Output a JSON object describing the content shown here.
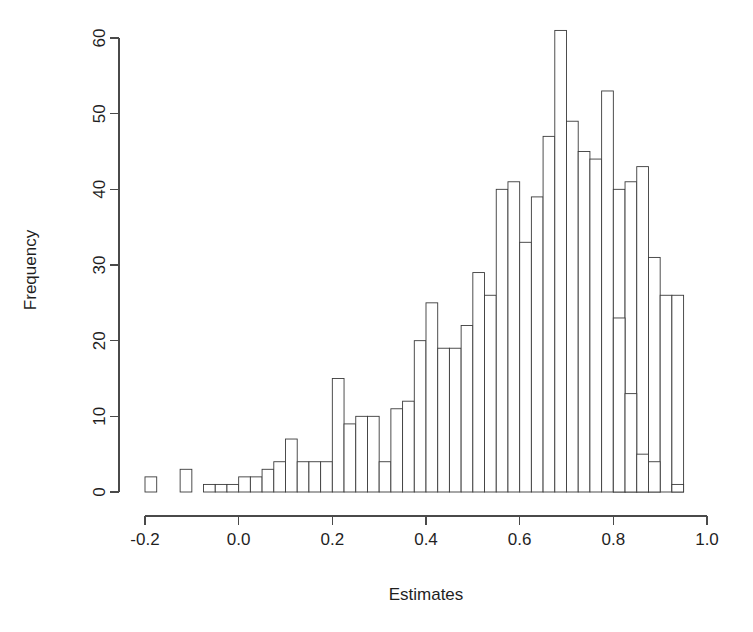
{
  "chart_data": {
    "type": "bar",
    "title": "",
    "subtitle": "",
    "xlabel": "Estimates",
    "ylabel": "Frequency",
    "grid": false,
    "legend": null,
    "xlim": [
      -0.2,
      1.0
    ],
    "ylim": [
      0,
      61
    ],
    "xticks": [
      -0.2,
      0.0,
      0.2,
      0.4,
      0.6,
      0.8,
      1.0
    ],
    "xtick_labels": [
      "-0.2",
      "0.0",
      "0.2",
      "0.4",
      "0.6",
      "0.8",
      "1.0"
    ],
    "yticks": [
      0,
      10,
      20,
      30,
      40,
      50,
      60
    ],
    "ytick_labels": [
      "0",
      "10",
      "20",
      "30",
      "40",
      "50",
      "60"
    ],
    "bin_width": 0.025,
    "bin_starts": [
      -0.2,
      -0.175,
      -0.15,
      -0.125,
      -0.1,
      -0.075,
      -0.05,
      -0.025,
      0.0,
      0.025,
      0.05,
      0.075,
      0.1,
      0.125,
      0.15,
      0.175,
      0.2,
      0.225,
      0.25,
      0.275,
      0.3,
      0.325,
      0.35,
      0.375,
      0.4,
      0.425,
      0.45,
      0.475,
      0.5,
      0.525,
      0.55,
      0.575,
      0.6,
      0.625,
      0.65,
      0.675,
      0.7,
      0.725,
      0.75,
      0.775,
      0.8,
      0.825,
      0.85,
      0.875,
      0.9,
      0.925
    ],
    "values": [
      2,
      0,
      0,
      3,
      0,
      1,
      1,
      1,
      2,
      2,
      3,
      4,
      7,
      4,
      4,
      4,
      15,
      9,
      10,
      10,
      4,
      11,
      12,
      20,
      25,
      19,
      19,
      22,
      29,
      26,
      40,
      41,
      33,
      39,
      47,
      61,
      49,
      45,
      44,
      53,
      40,
      41,
      43,
      31,
      26,
      26
    ],
    "tail_values": [
      23,
      13,
      5,
      4,
      0,
      1
    ],
    "tail_starts": [
      0.8,
      0.825,
      0.85,
      0.875,
      0.9,
      0.925
    ],
    "colors": {
      "bar_fill": "#ffffff",
      "bar_stroke": "#3b3b3b",
      "axis": "#4a4a4a",
      "text": "#1f1f1f",
      "background": "#ffffff"
    }
  },
  "axes": {
    "x_title": "Estimates",
    "y_title": "Frequency"
  }
}
